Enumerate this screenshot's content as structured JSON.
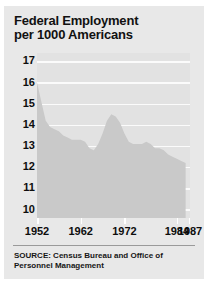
{
  "card": {
    "title_line1": "Federal Employment",
    "title_line2": "per 1000 Americans",
    "source_line1": "SOURCE: Census Bureau and Office of",
    "source_line2": "Personnel Management"
  },
  "colors": {
    "card_background": "#e8e8e8",
    "plot_background": "#e2e2e2",
    "area_fill": "#c9c9c9",
    "gridline": "#fbfbfb",
    "text": "#0d0d0d",
    "rule": "#9a9a9a"
  },
  "chart_data": {
    "type": "area",
    "title": "Federal Employment per 1000 Americans",
    "xlabel": "",
    "ylabel": "",
    "xlim": [
      1952,
      1987
    ],
    "ylim": [
      9.6,
      17.4
    ],
    "grid": true,
    "legend": null,
    "ytick_labels": [
      "17",
      "16",
      "15",
      "14",
      "13",
      "12",
      "11",
      "10"
    ],
    "yticks": [
      17,
      16,
      15,
      14,
      13,
      12,
      11,
      10
    ],
    "xtick_labels": [
      "1952",
      "1962",
      "1972",
      "1984",
      "1987"
    ],
    "xticks": [
      1952,
      1962,
      1972,
      1984,
      1987
    ],
    "series_name": "Federal employment per 1000 Americans",
    "x": [
      1952,
      1953,
      1954,
      1955,
      1956,
      1957,
      1958,
      1959,
      1960,
      1961,
      1962,
      1963,
      1964,
      1965,
      1966,
      1967,
      1968,
      1969,
      1970,
      1971,
      1972,
      1973,
      1974,
      1975,
      1976,
      1977,
      1978,
      1979,
      1980,
      1981,
      1982,
      1983,
      1984,
      1985,
      1986
    ],
    "values": [
      16.0,
      15.1,
      14.2,
      13.9,
      13.8,
      13.7,
      13.5,
      13.4,
      13.3,
      13.3,
      13.3,
      13.2,
      12.9,
      12.8,
      13.1,
      13.6,
      14.2,
      14.5,
      14.4,
      14.1,
      13.6,
      13.2,
      13.1,
      13.1,
      13.1,
      13.2,
      13.1,
      12.9,
      12.9,
      12.8,
      12.6,
      12.5,
      12.4,
      12.3,
      12.2
    ]
  }
}
